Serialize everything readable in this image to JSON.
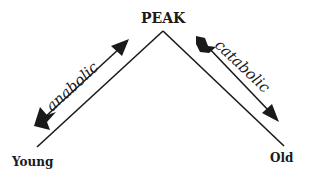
{
  "diagram": {
    "peak_label": "PEAK",
    "left_label": "Young",
    "right_label": "Old",
    "rising_arrow_label": "anabolic",
    "falling_arrow_label": "catabolic"
  },
  "colors": {
    "ink": "#1a1a1a",
    "background": "#ffffff"
  }
}
